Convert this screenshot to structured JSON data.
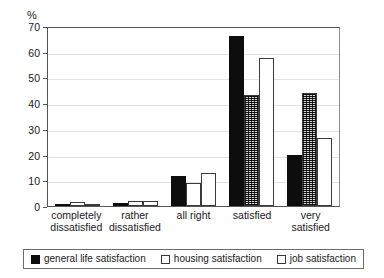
{
  "chart_data": {
    "type": "bar",
    "title": "",
    "subtitle": "",
    "xlabel": "",
    "ylabel": "%",
    "ylim": [
      0,
      70
    ],
    "ytick_step": 10,
    "yticks": [
      70,
      60,
      50,
      40,
      30,
      20,
      10,
      0
    ],
    "grid": true,
    "legend_position": "bottom",
    "categories": [
      "completely dissatisfied",
      "rather dissatisfied",
      "all right",
      "satisfied",
      "very satisfied"
    ],
    "category_lines": [
      [
        "completely",
        "dissatisfied"
      ],
      [
        "rather",
        "dissatisfied"
      ],
      [
        "all right",
        ""
      ],
      [
        "satisfied",
        ""
      ],
      [
        "very",
        "satisfied"
      ]
    ],
    "series": [
      {
        "name": "general life satisfaction",
        "color": "#0d0d0d",
        "fill": "solid-black",
        "values": [
          0.3,
          1.3,
          11.5,
          66.0,
          19.7
        ]
      },
      {
        "name": "housing satisfaction",
        "color": "#ffffff",
        "fill": "white-outline",
        "values": [
          1.5,
          1.8,
          9.0,
          43.0,
          44.0
        ]
      },
      {
        "name": "job satisfaction",
        "color": "#ffffff",
        "fill": "white-outline",
        "values": [
          0.2,
          1.8,
          13.0,
          57.5,
          26.5
        ]
      }
    ]
  },
  "legend": {
    "entries": [
      {
        "label": "general life satisfaction",
        "swatch": "black"
      },
      {
        "label": "housing satisfaction",
        "swatch": "white"
      },
      {
        "label": "job satisfaction",
        "swatch": "white"
      }
    ]
  },
  "colors": {
    "ink": "#0d0d0d",
    "outline": "#3a3a3a",
    "axis": "#555555",
    "grid": "#e2e2e2",
    "background": "#ffffff"
  }
}
